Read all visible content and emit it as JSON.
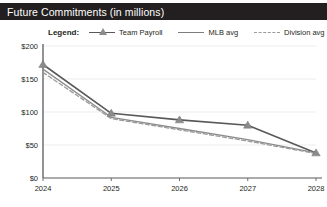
{
  "window": {
    "title": "Future Commitments (in millions)"
  },
  "legend": {
    "title": "Legend:",
    "entries": [
      {
        "label": "Team Payroll",
        "style": "line-marker",
        "color": "#58595b"
      },
      {
        "label": "MLB avg",
        "style": "solid",
        "color": "#8c8c8c"
      },
      {
        "label": "Division avg",
        "style": "dashed",
        "color": "#9a9a9a"
      }
    ]
  },
  "chart_data": {
    "type": "line",
    "title": "Future Commitments (in millions)",
    "xlabel": "",
    "ylabel": "",
    "x": [
      "2024",
      "2025",
      "2026",
      "2027",
      "2028"
    ],
    "categories": [
      "2024",
      "2025",
      "2026",
      "2027",
      "2028"
    ],
    "series": [
      {
        "name": "Team Payroll",
        "values": [
          172,
          98,
          88,
          80,
          38
        ],
        "color": "#58595b",
        "marker": "triangle",
        "dash": false
      },
      {
        "name": "MLB avg",
        "values": [
          165,
          92,
          75,
          58,
          38
        ],
        "color": "#8c8c8c",
        "marker": "none",
        "dash": false
      },
      {
        "name": "Division avg",
        "values": [
          160,
          90,
          73,
          56,
          37
        ],
        "color": "#9a9a9a",
        "marker": "none",
        "dash": true
      }
    ],
    "ylim": [
      0,
      200
    ],
    "yticks": [
      0,
      50,
      100,
      150,
      200
    ],
    "ytick_labels": [
      "$0",
      "$50",
      "$100",
      "$150",
      "$200"
    ],
    "xtick_labels": [
      "2024",
      "2025",
      "2026",
      "2027",
      "2028"
    ],
    "grid": true,
    "legend_position": "top"
  }
}
